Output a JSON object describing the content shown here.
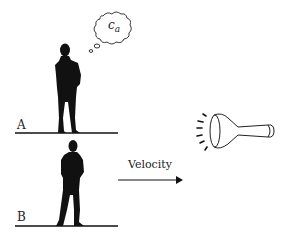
{
  "diagram": {
    "observers": [
      {
        "label": "A",
        "state": "stationary",
        "thought": "c",
        "thought_sub": "a"
      },
      {
        "label": "B",
        "state": "moving"
      }
    ],
    "arrow_label": "Velocity",
    "light_source": "flashlight",
    "colors": {
      "ink": "#111111",
      "background": "#ffffff"
    }
  }
}
